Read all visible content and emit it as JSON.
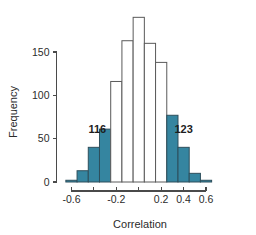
{
  "chart_data": {
    "type": "bar",
    "title": "",
    "xlabel": "Correlation",
    "ylabel": "Frequency",
    "xlim": [
      -0.72,
      0.68
    ],
    "ylim": [
      0,
      195
    ],
    "grid": false,
    "legend": null,
    "bin_width": 0.1,
    "x_ticks": [
      -0.6,
      -0.4,
      -0.2,
      0,
      0.2,
      0.4,
      0.6
    ],
    "x_tick_labels": [
      "-0.6",
      "",
      "-0.2",
      "",
      "0.2",
      "0.4",
      "0.6"
    ],
    "y_ticks": [
      0,
      50,
      100,
      150
    ],
    "y_tick_labels": [
      "0",
      "50",
      "100",
      "150"
    ],
    "accent_color": "#3585a0",
    "open_color": "#ffffff",
    "outline_color": "#5a5a5a",
    "bins": [
      {
        "left": -0.65,
        "right": -0.55,
        "value": 2,
        "shaded": true
      },
      {
        "left": -0.55,
        "right": -0.45,
        "value": 13,
        "shaded": true
      },
      {
        "left": -0.45,
        "right": -0.35,
        "value": 40,
        "shaded": true
      },
      {
        "left": -0.35,
        "right": -0.25,
        "value": 61,
        "shaded": true
      },
      {
        "left": -0.25,
        "right": -0.15,
        "value": 116,
        "shaded": false
      },
      {
        "left": -0.15,
        "right": -0.05,
        "value": 163,
        "shaded": false
      },
      {
        "left": -0.05,
        "right": 0.05,
        "value": 190,
        "shaded": false
      },
      {
        "left": 0.05,
        "right": 0.15,
        "value": 160,
        "shaded": false
      },
      {
        "left": 0.15,
        "right": 0.25,
        "value": 138,
        "shaded": false
      },
      {
        "left": 0.25,
        "right": 0.35,
        "value": 77,
        "shaded": true
      },
      {
        "left": 0.35,
        "right": 0.45,
        "value": 40,
        "shaded": true
      },
      {
        "left": 0.45,
        "right": 0.55,
        "value": 10,
        "shaded": true
      },
      {
        "left": 0.55,
        "right": 0.65,
        "value": 2,
        "shaded": true
      }
    ],
    "annotations": [
      {
        "text": "116",
        "x": -0.37,
        "y": 56
      },
      {
        "text": "123",
        "x": 0.4,
        "y": 56
      }
    ]
  }
}
